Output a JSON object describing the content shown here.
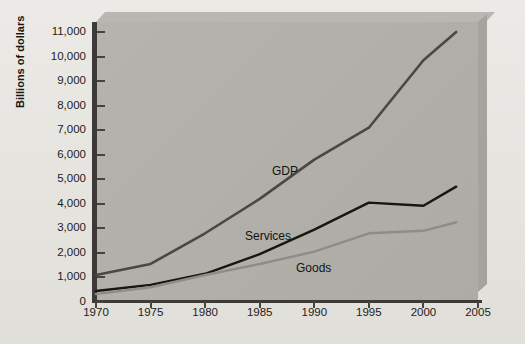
{
  "chart_data": {
    "type": "line",
    "title": "",
    "subtitle": "",
    "xlabel": "",
    "ylabel": "Billions of dollars",
    "xlim": [
      1970,
      2005
    ],
    "ylim": [
      0,
      11000
    ],
    "grid": false,
    "legend_position": "inline-annotations",
    "x_ticks": [
      "1970",
      "1975",
      "1980",
      "1985",
      "1990",
      "1995",
      "2000",
      "2005"
    ],
    "y_ticks": [
      "0",
      "1,000",
      "2,000",
      "3,000",
      "4,000",
      "5,000",
      "6,000",
      "7,000",
      "8,000",
      "9,000",
      "10,000",
      "11,000"
    ],
    "x": [
      1970,
      1975,
      1980,
      1985,
      1990,
      1995,
      2000,
      2003
    ],
    "series": [
      {
        "name": "GDP",
        "color": "#4a4844",
        "width": 2.6,
        "values": [
          1100,
          1550,
          2800,
          4200,
          5800,
          7100,
          9850,
          11000
        ],
        "label_x": 272,
        "label_y": 165
      },
      {
        "name": "Services",
        "color": "#17160f",
        "width": 2.4,
        "values": [
          450,
          700,
          1150,
          1950,
          2950,
          4050,
          3920,
          4700
        ],
        "label_x": 245,
        "label_y": 230
      },
      {
        "name": "Goods",
        "color": "#8e8c88",
        "width": 2.4,
        "values": [
          320,
          600,
          1100,
          1550,
          2050,
          2800,
          2900,
          3250
        ],
        "label_x": 296,
        "label_y": 262
      }
    ]
  },
  "axis": {
    "y_title": "Billions of dollars"
  }
}
